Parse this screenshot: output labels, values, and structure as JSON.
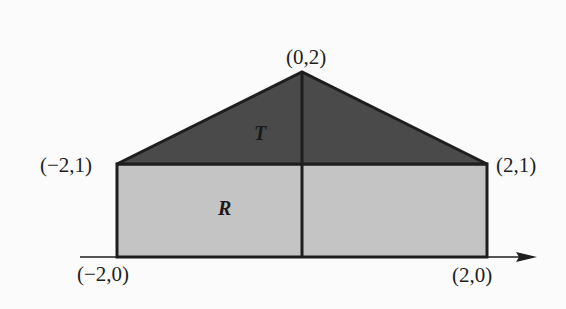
{
  "diagram": {
    "type": "geometric-region",
    "colors": {
      "background": "#fbfbfb",
      "triangle_fill": "#4a4a4a",
      "rectangle_fill": "#c4c4c4",
      "stroke": "#1e1e1e"
    },
    "regions": {
      "triangle": {
        "label": "T",
        "vertices": [
          "(-2,1)",
          "(0,2)",
          "(2,1)"
        ]
      },
      "rectangle": {
        "label": "R",
        "vertices": [
          "(-2,0)",
          "(2,0)",
          "(2,1)",
          "(-2,1)"
        ]
      }
    },
    "points": {
      "apex": "(0,2)",
      "top_left": "(−2,1)",
      "top_right": "(2,1)",
      "bottom_left": "(−2,0)",
      "bottom_right": "(2,0)"
    },
    "axis": {
      "name": "x-axis",
      "direction": "right"
    }
  }
}
